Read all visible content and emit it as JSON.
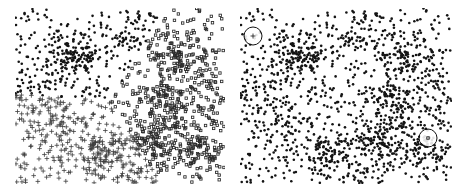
{
  "figure": {
    "background_color": "#ffffff",
    "width": 467,
    "height": 194,
    "panel_count": 2
  },
  "panels": [
    {
      "id": "left-panel",
      "name": "clustered-marker-scatter",
      "x": 15,
      "y": 8,
      "width": 210,
      "height": 176,
      "description": "Scatter plot rendered with three distinct marker glyphs indicating cluster assignment",
      "marker_color": "#1a1a1a",
      "marker_groups": [
        {
          "name": "group-filled-dot",
          "glyph": "filled-circle",
          "region": "upper-left",
          "color": "#141414",
          "size": 2.1
        },
        {
          "name": "group-plus",
          "glyph": "plus",
          "region": "lower-left",
          "color": "#3d3d3d",
          "size": 2.4
        },
        {
          "name": "group-open-square",
          "glyph": "open-square",
          "region": "right",
          "color": "#2a2a2a",
          "size": 2.6
        }
      ]
    },
    {
      "id": "right-panel",
      "name": "uniform-marker-scatter",
      "x": 240,
      "y": 8,
      "width": 212,
      "height": 176,
      "description": "Same point distribution rendered with a single uniform filled dot marker",
      "marker_color": "#141414",
      "marker_groups": [
        {
          "name": "group-uniform",
          "glyph": "filled-circle",
          "region": "all",
          "color": "#141414",
          "size": 2.1
        }
      ]
    }
  ],
  "annotations": [
    {
      "id": "annotation-circle-1",
      "name": "highlight-circle-plus-marker",
      "cx": 253,
      "cy": 36,
      "r": 9,
      "stroke_color": "#111111",
      "stroke_width": 1,
      "inner_marker": "plus",
      "label": ""
    },
    {
      "id": "annotation-circle-2",
      "name": "highlight-circle-square-marker",
      "cx": 428,
      "cy": 138,
      "r": 9,
      "stroke_color": "#111111",
      "stroke_width": 1,
      "inner_marker": "open-square",
      "label": ""
    }
  ],
  "chart_data": {
    "type": "scatter",
    "title": "",
    "subtitle": "",
    "xlabel": "",
    "ylabel": "",
    "grid": false,
    "legend": false,
    "axes_visible": false,
    "tick_labels": [],
    "xlim": [
      0,
      1
    ],
    "ylim": [
      0,
      1
    ],
    "point_count_per_panel": 1500,
    "structure": "ring / annulus shaped density with a diffuse outer scatter and several dense internal filaments",
    "panels": [
      {
        "panel": "left",
        "encoding": "marker-glyph-by-cluster",
        "series": [
          {
            "name": "cluster-a",
            "glyph": "filled-circle",
            "share": 0.36,
            "centroid": [
              0.3,
              0.74
            ]
          },
          {
            "name": "cluster-b",
            "glyph": "plus",
            "share": 0.27,
            "centroid": [
              0.26,
              0.24
            ]
          },
          {
            "name": "cluster-c",
            "glyph": "open-square",
            "share": 0.37,
            "centroid": [
              0.76,
              0.5
            ]
          }
        ]
      },
      {
        "panel": "right",
        "encoding": "uniform-marker",
        "series": [
          {
            "name": "all-points",
            "glyph": "filled-circle",
            "share": 1.0,
            "centroid": [
              0.5,
              0.5
            ]
          }
        ]
      }
    ],
    "density_features": [
      {
        "name": "outer-ring",
        "type": "annulus",
        "center": [
          0.5,
          0.5
        ],
        "inner_radius": 0.26,
        "outer_radius": 0.5,
        "weight": 0.55
      },
      {
        "name": "central-void",
        "type": "void",
        "center": [
          0.5,
          0.52
        ],
        "radius": 0.22,
        "weight": 0.08
      },
      {
        "name": "upper-left-clump",
        "type": "blob",
        "center": [
          0.3,
          0.72
        ],
        "radius": 0.055,
        "weight": 0.07
      },
      {
        "name": "right-filament",
        "type": "blob",
        "center": [
          0.7,
          0.47
        ],
        "radius": 0.07,
        "weight": 0.08
      },
      {
        "name": "lower-right-filament",
        "type": "blob",
        "center": [
          0.66,
          0.26
        ],
        "radius": 0.06,
        "weight": 0.06
      },
      {
        "name": "lower-center-clump",
        "type": "blob",
        "center": [
          0.42,
          0.2
        ],
        "radius": 0.055,
        "weight": 0.06
      },
      {
        "name": "upper-right-clump",
        "type": "blob",
        "center": [
          0.78,
          0.7
        ],
        "radius": 0.05,
        "weight": 0.05
      },
      {
        "name": "far-right-clump",
        "type": "blob",
        "center": [
          0.88,
          0.18
        ],
        "radius": 0.045,
        "weight": 0.05
      }
    ]
  }
}
